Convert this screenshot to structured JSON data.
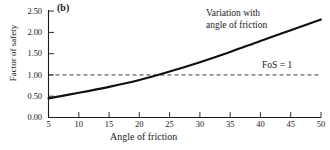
{
  "figure": {
    "panel_label": "(b)",
    "series_annotation_line1": "Variation with",
    "series_annotation_line2": "angle of friction",
    "reference_annotation": "FoS = 1"
  },
  "chart_data": {
    "type": "line",
    "title": "",
    "panel": "(b)",
    "xlabel": "Angle of friction",
    "ylabel": "Factor of safety",
    "xlim": [
      5,
      50
    ],
    "ylim": [
      0.0,
      2.5
    ],
    "xticks": [
      5,
      10,
      15,
      20,
      25,
      30,
      35,
      40,
      45,
      50
    ],
    "xtick_labels": [
      "5",
      "10",
      "15",
      "20",
      "25",
      "30",
      "35",
      "40",
      "45",
      "50"
    ],
    "yticks": [
      0.0,
      0.5,
      1.0,
      1.5,
      2.0,
      2.5
    ],
    "ytick_labels": [
      "0.00",
      "0.50",
      "1.00",
      "1.50",
      "2.00",
      "2.50"
    ],
    "grid": false,
    "legend": "none",
    "series": [
      {
        "name": "Variation with angle of friction",
        "style": "solid",
        "color": "#101010",
        "x": [
          5,
          10,
          15,
          20,
          25,
          30,
          35,
          40,
          45,
          50
        ],
        "values": [
          0.45,
          0.58,
          0.72,
          0.88,
          1.08,
          1.3,
          1.54,
          1.8,
          2.05,
          2.3
        ]
      },
      {
        "name": "FoS = 1",
        "style": "dashed",
        "color": "#2a2a2a",
        "x": [
          5,
          50
        ],
        "values": [
          1.0,
          1.0
        ]
      }
    ],
    "annotations": [
      {
        "text": "Variation with angle of friction",
        "x": 33,
        "y": 2.35
      },
      {
        "text": "FoS = 1",
        "x": 42,
        "y": 1.18
      },
      {
        "text": "(b)",
        "x": 6,
        "y": 2.48
      }
    ],
    "intersection": {
      "x": 21.7,
      "y": 1.0
    }
  }
}
